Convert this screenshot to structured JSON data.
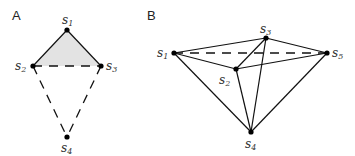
{
  "panels": [
    {
      "label": "A",
      "vertices": [
        {
          "name": "s",
          "sub": "1",
          "x": 67,
          "y": 30,
          "lx": 62,
          "ly": 24
        },
        {
          "name": "s",
          "sub": "2",
          "x": 33,
          "y": 66,
          "lx": 15,
          "ly": 70
        },
        {
          "name": "s",
          "sub": "3",
          "x": 101,
          "y": 66,
          "lx": 106,
          "ly": 70
        },
        {
          "name": "s",
          "sub": "4",
          "x": 67,
          "y": 137,
          "lx": 61,
          "ly": 152
        }
      ],
      "solid_edges": [
        [
          0,
          1
        ],
        [
          0,
          2
        ]
      ],
      "dashed_edges": [
        [
          1,
          2
        ],
        [
          1,
          3
        ],
        [
          2,
          3
        ]
      ],
      "shaded_face": [
        0,
        1,
        2
      ],
      "shade_color": "#e3e3e3"
    },
    {
      "label": "B",
      "vertices": [
        {
          "name": "s",
          "sub": "1",
          "x": 174,
          "y": 53,
          "lx": 157,
          "ly": 57
        },
        {
          "name": "s",
          "sub": "2",
          "x": 236,
          "y": 69,
          "lx": 219,
          "ly": 84
        },
        {
          "name": "s",
          "sub": "3",
          "x": 266,
          "y": 38,
          "lx": 260,
          "ly": 33
        },
        {
          "name": "s",
          "sub": "4",
          "x": 251,
          "y": 132,
          "lx": 245,
          "ly": 148
        },
        {
          "name": "s",
          "sub": "5",
          "x": 327,
          "y": 53,
          "lx": 332,
          "ly": 57
        }
      ],
      "solid_edges": [
        [
          0,
          2
        ],
        [
          0,
          1
        ],
        [
          2,
          4
        ],
        [
          1,
          4
        ],
        [
          0,
          3
        ],
        [
          1,
          3
        ],
        [
          2,
          3
        ],
        [
          4,
          3
        ],
        [
          1,
          2
        ]
      ],
      "dashed_edges": [
        [
          0,
          4
        ]
      ]
    }
  ],
  "colors": {
    "line": "#111111",
    "vertex": "#000000",
    "shade": "#e3e3e3"
  }
}
